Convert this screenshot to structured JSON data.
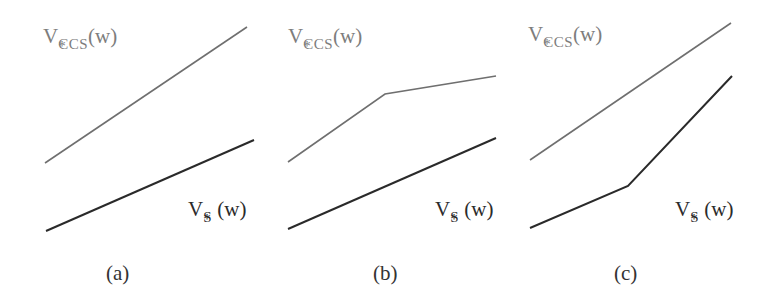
{
  "colors": {
    "ccs_line": "#6f6f6f",
    "s_line": "#2a2a2a",
    "ccs_label": "#7d7d7d",
    "s_label": "#2b2b2b"
  },
  "labels": {
    "ccs": {
      "base": "V",
      "sup": "*",
      "sub": "CCS",
      "arg": "(w)"
    },
    "s": {
      "base": "V",
      "sup": "*",
      "sub": "S",
      "arg": "(w)"
    }
  },
  "panels": [
    {
      "caption": "(a)",
      "ccs_points": [
        [
          45,
          163
        ],
        [
          247,
          27
        ]
      ],
      "s_points": [
        [
          46,
          231
        ],
        [
          254,
          140
        ]
      ]
    },
    {
      "caption": "(b)",
      "ccs_points": [
        [
          288,
          162
        ],
        [
          385,
          94
        ],
        [
          496,
          76
        ]
      ],
      "s_points": [
        [
          288,
          229
        ],
        [
          496,
          138
        ]
      ]
    },
    {
      "caption": "(c)",
      "ccs_points": [
        [
          530,
          160
        ],
        [
          731,
          23
        ]
      ],
      "s_points": [
        [
          530,
          228
        ],
        [
          628,
          186
        ],
        [
          732,
          76
        ]
      ]
    }
  ]
}
